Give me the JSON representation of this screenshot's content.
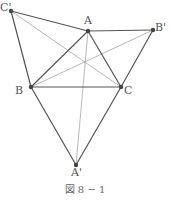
{
  "figure": {
    "caption": "図 8 − 1",
    "points": {
      "A": {
        "label": "A",
        "x": 88,
        "y": 31
      },
      "B": {
        "label": "B",
        "x": 31,
        "y": 87
      },
      "C": {
        "label": "C",
        "x": 121,
        "y": 87
      },
      "Ap": {
        "label": "A'",
        "x": 76,
        "y": 165
      },
      "Bp": {
        "label": "B'",
        "x": 153,
        "y": 30
      },
      "Cp": {
        "label": "C'",
        "x": 11,
        "y": 11
      }
    },
    "thick_segments": [
      [
        "A",
        "B"
      ],
      [
        "B",
        "C"
      ],
      [
        "C",
        "A"
      ],
      [
        "Cp",
        "A"
      ],
      [
        "Cp",
        "B"
      ],
      [
        "A",
        "Bp"
      ],
      [
        "Bp",
        "C"
      ],
      [
        "B",
        "Ap"
      ],
      [
        "C",
        "Ap"
      ]
    ],
    "thin_segments": [
      [
        "Cp",
        "C"
      ],
      [
        "Bp",
        "B"
      ],
      [
        "A",
        "Ap"
      ]
    ],
    "colors": {
      "thick": "#555555",
      "thin": "#999999",
      "point": "#444444"
    }
  }
}
